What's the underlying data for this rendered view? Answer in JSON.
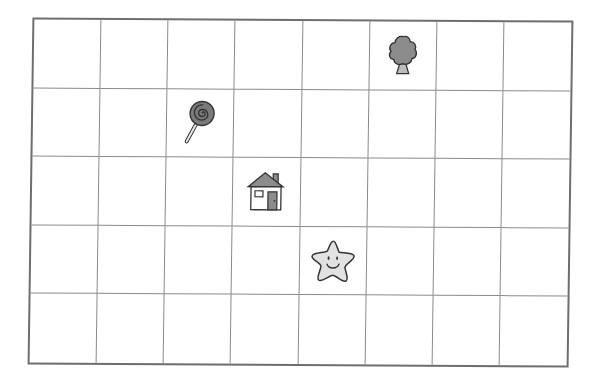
{
  "grid": {
    "columns": 8,
    "rows": 5,
    "line_color": "#8a8a8a",
    "border_color": "#6e6e6e"
  },
  "items": [
    {
      "name": "tree",
      "icon": "tree-icon",
      "column": 6,
      "row": 1,
      "fill": "#8c8c8c"
    },
    {
      "name": "lollipop",
      "icon": "lollipop-icon",
      "column": 3,
      "row": 2,
      "fill": "#7a7a7a"
    },
    {
      "name": "house",
      "icon": "house-icon",
      "column": 4,
      "row": 3,
      "fill": "#8c8c8c"
    },
    {
      "name": "star",
      "icon": "star-icon",
      "column": 5,
      "row": 4,
      "fill": "#e2e2e2"
    }
  ]
}
